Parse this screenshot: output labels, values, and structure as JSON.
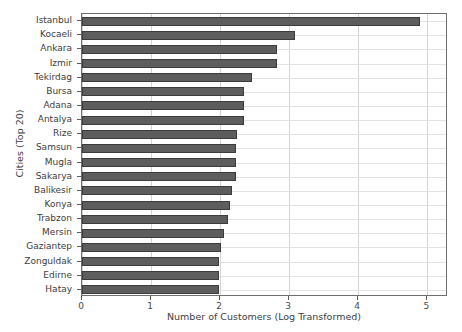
{
  "chart_data": {
    "type": "bar",
    "orientation": "horizontal",
    "title": "",
    "xlabel": "Number of Customers (Log Transformed)",
    "ylabel": "Cities (Top 20)",
    "xlim": [
      0,
      5.3
    ],
    "ylim_categories": 20,
    "xticks": [
      0,
      1,
      2,
      3,
      4,
      5
    ],
    "xtick_labels": [
      "0",
      "1",
      "2",
      "3",
      "4",
      "5"
    ],
    "grid": true,
    "legend": null,
    "bar_color": "#5d5d5d",
    "bar_edge_color": "#3c3c3c",
    "categories": [
      "Istanbul",
      "Kocaeli",
      "Ankara",
      "Izmir",
      "Tekirdag",
      "Bursa",
      "Adana",
      "Antalya",
      "Rize",
      "Samsun",
      "Mugla",
      "Sakarya",
      "Balikesir",
      "Konya",
      "Trabzon",
      "Mersin",
      "Gaziantep",
      "Zonguldak",
      "Edirne",
      "Hatay"
    ],
    "values": [
      4.9,
      3.08,
      2.82,
      2.82,
      2.46,
      2.34,
      2.34,
      2.34,
      2.24,
      2.23,
      2.23,
      2.23,
      2.17,
      2.14,
      2.11,
      2.06,
      2.01,
      1.98,
      1.98,
      1.98
    ]
  }
}
